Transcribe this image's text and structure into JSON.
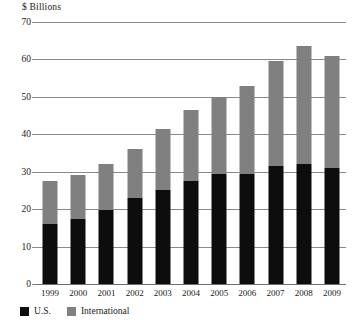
{
  "chart_data": {
    "type": "bar",
    "stacked": true,
    "title": "",
    "subtitle": "",
    "xlabel": "",
    "ylabel": "$ Billions",
    "ylim": [
      0,
      70
    ],
    "ytick_step": 10,
    "yticks": [
      0,
      10,
      20,
      30,
      40,
      50,
      60,
      70
    ],
    "grid": true,
    "legend_position": "bottom-left",
    "categories": [
      "1999",
      "2000",
      "2001",
      "2002",
      "2003",
      "2004",
      "2005",
      "2006",
      "2007",
      "2008",
      "2009"
    ],
    "series": [
      {
        "name": "U.S.",
        "color": "#0d0d0d",
        "values": [
          16.0,
          17.5,
          19.8,
          23.0,
          25.0,
          27.5,
          29.5,
          29.5,
          31.5,
          32.0,
          31.0
        ]
      },
      {
        "name": "International",
        "color": "#808080",
        "values": [
          11.5,
          11.5,
          12.2,
          13.0,
          16.5,
          19.0,
          20.5,
          23.5,
          28.0,
          31.5,
          30.0
        ]
      }
    ],
    "totals": [
      27.5,
      29.0,
      32.0,
      36.0,
      41.5,
      46.5,
      50.0,
      53.0,
      59.5,
      63.5,
      61.0
    ]
  },
  "legend": {
    "items": [
      {
        "label": "U.S.",
        "color": "#0d0d0d"
      },
      {
        "label": "International",
        "color": "#808080"
      }
    ]
  }
}
